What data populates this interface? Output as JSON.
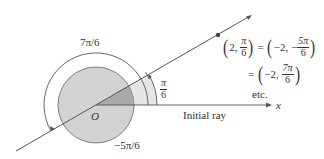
{
  "diagram": {
    "labels": {
      "angle_7pi6": "7π/6",
      "angle_neg5pi6": "−5π/6",
      "angle_pi6_num": "π",
      "angle_pi6_den": "6",
      "origin": "O",
      "initial_ray": "Initial ray",
      "x_axis": "x"
    },
    "equation": {
      "line1": {
        "lhs_r": "2,",
        "lhs_num": "π",
        "lhs_den": "6",
        "eq": "=",
        "rhs_r": "−2, −",
        "rhs_num": "5π",
        "rhs_den": "6"
      },
      "line2": {
        "eq": "=",
        "rhs_r": "−2,",
        "rhs_num": "7π",
        "rhs_den": "6"
      },
      "etc": "etc."
    },
    "colors": {
      "inner_disk": "#d4d4d4",
      "sector_light": "#e8e8e8",
      "sector_dark": "#a8a8a8",
      "line": "#555555",
      "point": "#444444"
    }
  }
}
